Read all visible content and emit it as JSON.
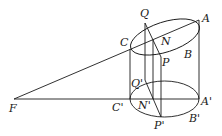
{
  "diagram": {
    "labels": {
      "Q": "Q",
      "A": "A",
      "C": "C",
      "N": "N",
      "B": "B",
      "P": "P",
      "Q1": "Q'",
      "F": "F",
      "C1": "C'",
      "N1": "N'",
      "A1": "A'",
      "P1": "P'",
      "B1": "B'"
    },
    "points": {
      "F": [
        14,
        99
      ],
      "Q": [
        145,
        23
      ],
      "A": [
        199,
        20
      ],
      "C": [
        130,
        49
      ],
      "N": [
        153,
        40
      ],
      "P": [
        161,
        57
      ],
      "Q1": [
        145,
        80
      ],
      "C1": [
        130,
        99
      ],
      "N1": [
        152,
        99
      ],
      "A1": [
        199,
        99
      ],
      "P1": [
        161,
        117
      ]
    },
    "colors": {
      "line": "#1a1a1a",
      "background": "#ffffff"
    }
  }
}
